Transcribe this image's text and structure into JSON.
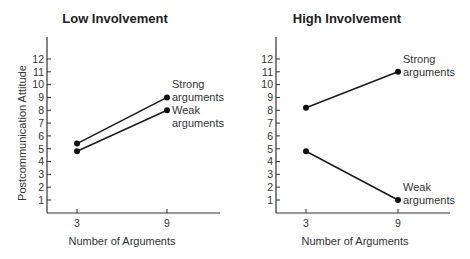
{
  "chart_data": [
    {
      "type": "line",
      "title": "Low Involvement",
      "xlabel": "Number of Arguments",
      "ylabel": "Postcommunication Attitude",
      "x": [
        3,
        9
      ],
      "x_ticks": [
        "3",
        "9"
      ],
      "y_ticks": [
        "1",
        "2",
        "3",
        "4",
        "5",
        "6",
        "7",
        "8",
        "9",
        "10",
        "11",
        "12"
      ],
      "ylim": [
        0,
        13
      ],
      "grid": false,
      "series": [
        {
          "name": "Strong arguments",
          "values": [
            5.4,
            9
          ]
        },
        {
          "name": "Weak arguments",
          "values": [
            4.8,
            8
          ]
        }
      ],
      "annotations": [
        {
          "line1": "Strong",
          "line2": "arguments"
        },
        {
          "line1": "Weak",
          "line2": "arguments"
        }
      ]
    },
    {
      "type": "line",
      "title": "High Involvement",
      "xlabel": "Number of Arguments",
      "ylabel": "",
      "x": [
        3,
        9
      ],
      "x_ticks": [
        "3",
        "9"
      ],
      "y_ticks": [
        "1",
        "2",
        "3",
        "4",
        "5",
        "6",
        "7",
        "8",
        "9",
        "10",
        "11",
        "12"
      ],
      "ylim": [
        0,
        13
      ],
      "grid": false,
      "series": [
        {
          "name": "Strong arguments",
          "values": [
            8.2,
            11
          ]
        },
        {
          "name": "Weak arguments",
          "values": [
            4.8,
            1
          ]
        }
      ],
      "annotations": [
        {
          "line1": "Strong",
          "line2": "arguments"
        },
        {
          "line1": "Weak",
          "line2": "arguments"
        }
      ]
    }
  ]
}
